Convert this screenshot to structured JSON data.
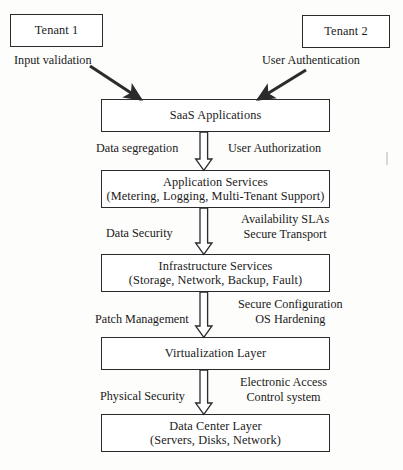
{
  "diagram": {
    "type": "layered-stack-flow",
    "tenants": [
      {
        "id": "tenant-1",
        "label": "Tenant 1",
        "control": "Input validation"
      },
      {
        "id": "tenant-2",
        "label": "Tenant 2",
        "control": "User Authentication"
      }
    ],
    "layers": [
      {
        "id": "saas-applications",
        "line1": "SaaS Applications",
        "line2": ""
      },
      {
        "id": "application-services",
        "line1": "Application Services",
        "line2": "(Metering, Logging, Multi-Tenant Support)"
      },
      {
        "id": "infrastructure-services",
        "line1": "Infrastructure Services",
        "line2": "(Storage, Network, Backup, Fault)"
      },
      {
        "id": "virtualization-layer",
        "line1": "Virtualization Layer",
        "line2": ""
      },
      {
        "id": "data-center-layer",
        "line1": "Data Center Layer",
        "line2": "(Servers, Disks, Network)"
      }
    ],
    "transitions": [
      {
        "id": "saas-to-application-services",
        "left_label": "Data segregation",
        "right_label_line1": "User Authorization",
        "right_label_line2": ""
      },
      {
        "id": "application-to-infrastructure-services",
        "left_label": "Data Security",
        "right_label_line1": "Availability SLAs",
        "right_label_line2": "Secure Transport"
      },
      {
        "id": "infrastructure-to-virtualization",
        "left_label": "Patch Management",
        "right_label_line1": "Secure Configuration",
        "right_label_line2": "OS Hardening"
      },
      {
        "id": "virtualization-to-data-center",
        "left_label": "Physical Security",
        "right_label_line1": "Electronic Access",
        "right_label_line2": "Control system"
      }
    ],
    "colors": {
      "stroke": "#2b2b2b",
      "text": "#1a1a1a",
      "fill": "#ffffff",
      "page": "#fdfdfc"
    }
  }
}
